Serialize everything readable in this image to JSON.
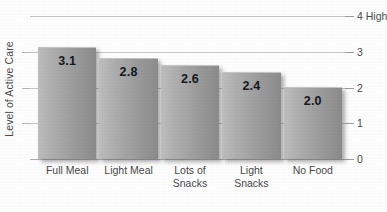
{
  "chart_data": {
    "type": "bar",
    "title": "",
    "subtitle": "",
    "xlabel": "",
    "ylabel": "Level of Active Care",
    "categories": [
      "Full Meal",
      "Light Meal",
      "Lots of Snacks",
      "Light Snacks",
      "No Food"
    ],
    "category_lines": [
      [
        "Full Meal"
      ],
      [
        "Light Meal"
      ],
      [
        "Lots of",
        "Snacks"
      ],
      [
        "Light Snacks"
      ],
      [
        "No Food"
      ]
    ],
    "values": [
      3.1,
      2.8,
      2.6,
      2.4,
      2.0
    ],
    "value_labels": [
      "3.1",
      "2.8",
      "2.6",
      "2.4",
      "2.0"
    ],
    "ylim": [
      0,
      4
    ],
    "y_ticks": [
      0,
      1,
      2,
      3,
      4
    ],
    "y_tick_labels": [
      "0",
      "1",
      "2",
      "3",
      "4 High"
    ],
    "y_axis_side": "right",
    "grid": true,
    "legend": "none",
    "bar_fill_light": "#bfbfbf",
    "bar_fill_dark": "#8c8c8c",
    "gridline_color": "#c9c9c9",
    "value_label_color": "#15181c",
    "text_color": "#4a4a4a"
  }
}
